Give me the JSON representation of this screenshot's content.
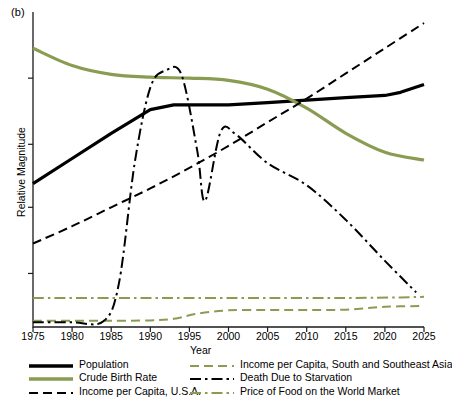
{
  "figure": {
    "panel_label": "(b)",
    "xlabel": "Year",
    "ylabel": "Relative Magnitude"
  },
  "legend": {
    "left": [
      {
        "label": "Population",
        "style": "solid-thick",
        "color": "#000000"
      },
      {
        "label": "Crude Birth Rate",
        "style": "solid-thick",
        "color": "#8a9c52"
      },
      {
        "label": "Income per Capita, U.S.A.",
        "style": "dashed",
        "color": "#000000"
      }
    ],
    "right": [
      {
        "label": "Income per Capita, South and Southeast Asia",
        "style": "dashed",
        "color": "#8a9c52"
      },
      {
        "label": "Death Due to Starvation",
        "style": "dash-dot",
        "color": "#000000"
      },
      {
        "label": "Price of Food on the World Market",
        "style": "dash-dot",
        "color": "#8a9c52"
      }
    ]
  },
  "chart_data": {
    "type": "line",
    "title": "",
    "xlabel": "Year",
    "ylabel": "Relative Magnitude",
    "xlim": [
      1975,
      2025
    ],
    "ylim": [
      0,
      100
    ],
    "xticks": [
      1975,
      1980,
      1985,
      1990,
      1995,
      2000,
      2005,
      2010,
      2015,
      2020,
      2025
    ],
    "xtick_labels": [
      "1975",
      "1980",
      "1985",
      "1990",
      "1995",
      "2000",
      "2005",
      "2010",
      "2015",
      "2020",
      "2025"
    ],
    "yticks": [
      17,
      38,
      58,
      79
    ],
    "ytick_labels": [
      "",
      "",
      "",
      ""
    ],
    "grid": false,
    "legend_position": "below",
    "axis_frame": "left-bottom",
    "series": [
      {
        "name": "Population",
        "color": "#000000",
        "style": "solid-thick",
        "x": [
          1975,
          1980,
          1985,
          1990,
          1993,
          2000,
          2005,
          2010,
          2015,
          2020,
          2022,
          2025
        ],
        "values": [
          45.5,
          53.5,
          61.5,
          69.0,
          70.5,
          70.5,
          71.2,
          72.0,
          72.8,
          73.5,
          74.5,
          77.0
        ]
      },
      {
        "name": "Crude Birth Rate",
        "color": "#8a9c52",
        "style": "solid-thick",
        "x": [
          1975,
          1980,
          1985,
          1990,
          1995,
          2000,
          2005,
          2010,
          2015,
          2020,
          2025
        ],
        "values": [
          88.5,
          83.0,
          80.2,
          79.3,
          79.0,
          78.3,
          75.5,
          69.5,
          61.5,
          55.5,
          53.0
        ]
      },
      {
        "name": "Income per Capita, U.S.A.",
        "color": "#000000",
        "style": "dashed",
        "x": [
          1975,
          1980,
          1985,
          1990,
          1995,
          2000,
          2005,
          2010,
          2015,
          2020,
          2025
        ],
        "values": [
          26.5,
          32.0,
          38.0,
          44.0,
          50.5,
          57.5,
          65.0,
          72.5,
          80.5,
          88.5,
          96.5
        ]
      },
      {
        "name": "Income per Capita, South and Southeast Asia",
        "color": "#8a9c52",
        "style": "dashed",
        "x": [
          1975,
          1980,
          1985,
          1990,
          1993,
          1996,
          2000,
          2005,
          2010,
          2015,
          2020,
          2025
        ],
        "values": [
          2.0,
          2.0,
          2.0,
          2.1,
          2.6,
          4.2,
          5.3,
          5.4,
          5.4,
          5.5,
          6.4,
          6.7
        ]
      },
      {
        "name": "Death Due to Starvation",
        "color": "#000000",
        "style": "dash-dot",
        "x": [
          1975,
          1980,
          1984,
          1986,
          1988,
          1990,
          1992,
          1994,
          1996,
          1997,
          1999,
          2001,
          2005,
          2010,
          2015,
          2020,
          2024
        ],
        "values": [
          1.5,
          1.5,
          1.8,
          14.0,
          52.0,
          76.0,
          81.5,
          80.0,
          56.0,
          40.0,
          62.0,
          61.0,
          52.0,
          45.0,
          34.0,
          21.0,
          11.0
        ]
      },
      {
        "name": "Price of Food on the World Market",
        "color": "#8a9c52",
        "style": "dash-dot",
        "x": [
          1975,
          1985,
          1995,
          2005,
          2015,
          2022,
          2025
        ],
        "values": [
          9.2,
          9.2,
          9.2,
          9.2,
          9.2,
          9.4,
          9.6
        ]
      }
    ]
  }
}
